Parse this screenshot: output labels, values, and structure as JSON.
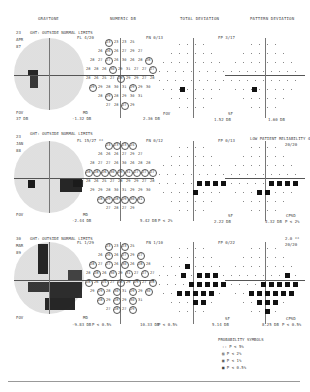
{
  "headers": {
    "grayscale": "GRAYTONE",
    "numeric": "NUMERIC DB",
    "total_deviation": "TOTAL DEVIATION",
    "pattern_deviation": "PATTERN DEVIATION"
  },
  "tests": [
    {
      "ght": "GHT: OUTSIDE NORMAL LIMITS",
      "fl": "FL 4/20",
      "fn": "FN 0/13",
      "fp": "FP 3/17",
      "side_labels": [
        "23",
        "APR",
        "87"
      ],
      "fov": "FOV",
      "fov_val": "37 DB",
      "md_label": "MD",
      "md_val": "-1.32 DB",
      "numeric_mean": "2.36 DB",
      "sf_label": "SF",
      "sf_val": "1.52 DB",
      "cpsd_label": "",
      "cpsd_val": "1.60 DB",
      "extra_top": "",
      "extra_top2": ""
    },
    {
      "ght": "GHT: OUTSIDE NORMAL LIMITS",
      "fl": "FL 15/27 **",
      "fn": "FN 0/12",
      "fp": "FP 0/13",
      "side_labels": [
        "23",
        "JAN",
        "88"
      ],
      "fov": "FOV",
      "fov_val": "",
      "md_label": "MD",
      "md_val": "-2.44 DB",
      "numeric_mean": "5.42 DB",
      "numeric_p": "P < 2%",
      "sf_label": "SF",
      "sf_val": "2.22 DB",
      "cpsd_label": "CPSD",
      "cpsd_val": "4.32 DB",
      "cpsd_p": "P < 2%",
      "extra_top": "LOW PATIENT RELIABILITY 4.0 **",
      "extra_top2": "20/20"
    },
    {
      "ght": "GHT: OUTSIDE NORMAL LIMITS",
      "fl": "FL 1/29",
      "fn": "FN 1/10",
      "fp": "FP 0/22",
      "side_labels": [
        "30",
        "MAR",
        "89"
      ],
      "fov": "FOV",
      "fov_val": "",
      "md_label": "MD",
      "md_val": "-9.83 DB",
      "md_p": "P < 0.5%",
      "numeric_mean": "10.33 DB",
      "numeric_p": "P < 0.5%",
      "sf_label": "SF",
      "sf_val": "5.14 DB",
      "cpsd_label": "CPSD",
      "cpsd_val": "8.25 DB",
      "cpsd_p": "P < 0.5%",
      "extra_top": "2.0 **",
      "extra_top2": "20/20"
    }
  ],
  "legend": {
    "title": "PROBABILITY SYMBOLS",
    "items": [
      {
        "symbol": "::",
        "label": "P < 5%"
      },
      {
        "symbol": "▨",
        "label": "P < 2%"
      },
      {
        "symbol": "▩",
        "label": "P < 1%"
      },
      {
        "symbol": "■",
        "label": "P < 0.5%"
      }
    ]
  },
  "numeric_rows_1": [
    [
      "23",
      "23",
      "23",
      "25"
    ],
    [
      "26",
      "26",
      "26",
      "27",
      "29",
      "27"
    ],
    [
      "28",
      "27",
      "27",
      "26",
      "30",
      "26",
      "28",
      "28"
    ],
    [
      "28",
      "28",
      "26",
      "30",
      "29",
      "31",
      "27",
      "27",
      "27"
    ],
    [
      "28",
      "26",
      "25",
      "27",
      "28",
      "29",
      "29",
      "27",
      "28"
    ],
    [
      "29",
      "29",
      "28",
      "30",
      "31",
      "29",
      "29",
      "30"
    ],
    [
      "28",
      "29",
      "28",
      "29",
      "30",
      "31"
    ],
    [
      "27",
      "28",
      "27",
      "29"
    ]
  ]
}
